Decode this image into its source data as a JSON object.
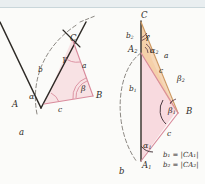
{
  "figure": {
    "colors": {
      "paper": "#fbfbf9",
      "pink_fill": "#f6cdd4",
      "tan_fill": "#f5cfa8",
      "pink_line": "#d98b9c",
      "tan_line": "#cf9a63",
      "dark_line": "#2e2a26",
      "dashed_arc": "#6d6862",
      "text": "#3a3530",
      "top_strip": "#e9eef0"
    },
    "panel_a": {
      "caption": "a",
      "vertices": [
        {
          "name": "vertex-A",
          "label": "A"
        },
        {
          "name": "vertex-B",
          "label": "B"
        },
        {
          "name": "vertex-C",
          "label": "C"
        }
      ],
      "sides": [
        {
          "name": "side-a",
          "label": "a"
        },
        {
          "name": "side-b",
          "label": "b"
        },
        {
          "name": "side-c",
          "label": "c"
        }
      ],
      "angles": [
        {
          "name": "angle-alpha",
          "label": "α"
        },
        {
          "name": "angle-beta",
          "label": "β"
        },
        {
          "name": "angle-gamma",
          "label": "γ"
        }
      ]
    },
    "panel_b": {
      "caption": "b",
      "vertices": [
        {
          "name": "vertex-C",
          "label": "C"
        },
        {
          "name": "vertex-B",
          "label": "B"
        },
        {
          "name": "vertex-A1",
          "label": "A",
          "sub": "1"
        },
        {
          "name": "vertex-A2",
          "label": "A",
          "sub": "2"
        }
      ],
      "sides": [
        {
          "name": "side-a",
          "label": "a"
        },
        {
          "name": "side-c-upper",
          "label": "c"
        },
        {
          "name": "side-c-lower",
          "label": "c"
        },
        {
          "name": "side-b1",
          "label": "b",
          "sub": "1"
        },
        {
          "name": "side-b2",
          "label": "b",
          "sub": "2"
        }
      ],
      "angles": [
        {
          "name": "angle-gamma",
          "label": "γ"
        },
        {
          "name": "angle-alpha1",
          "label": "α",
          "sub": "1"
        },
        {
          "name": "angle-alpha2",
          "label": "α",
          "sub": "2"
        },
        {
          "name": "angle-beta1",
          "label": "β",
          "sub": "1"
        },
        {
          "name": "angle-beta2",
          "label": "β",
          "sub": "2"
        }
      ],
      "legend": [
        {
          "name": "legend-b1",
          "text": "b₁ = |CA₁|"
        },
        {
          "name": "legend-b2",
          "text": "b₂ = |CA₂|"
        }
      ]
    }
  }
}
